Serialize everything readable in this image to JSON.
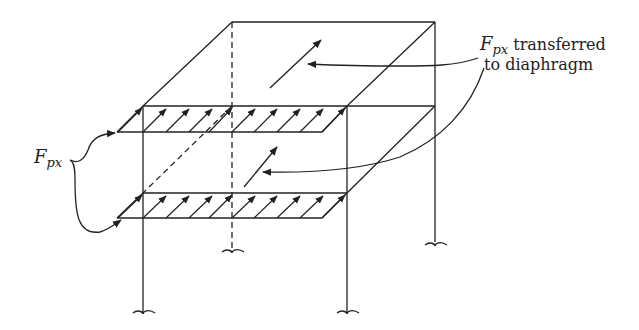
{
  "diagram": {
    "type": "structural-frame-isometric",
    "labels": {
      "left": {
        "main": "F",
        "subscript": "px"
      },
      "right": {
        "main": "F",
        "subscript": "px",
        "line1_rest": " transferred",
        "line2": "to diaphragm"
      }
    },
    "elements": {
      "roof_diaphragm": "Roof level with single in-plane arrow",
      "upper_floor_band": "Upper floor edge with 9 distributed arrows",
      "lower_floor_band": "Lower floor edge with 9 distributed arrows",
      "columns": [
        "front-left",
        "front-right",
        "back-left (hidden, dashed)",
        "back-right"
      ]
    },
    "colors": {
      "line": "#222222",
      "background": "#ffffff"
    }
  }
}
